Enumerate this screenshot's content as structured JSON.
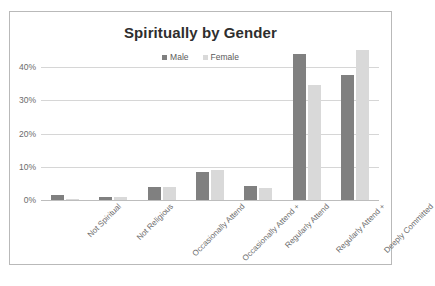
{
  "chart_data": {
    "type": "bar",
    "title": "Spiritually by Gender",
    "xlabel": "",
    "ylabel": "",
    "ylim": [
      0,
      45
    ],
    "ytick_labels": [
      "40%",
      "30%",
      "20%",
      "10%",
      "0%"
    ],
    "ytick_values": [
      40,
      30,
      20,
      10,
      0
    ],
    "grid": true,
    "legend_position": "top-center",
    "categories": [
      "Not Spiritual",
      "Not Religious",
      "Occasionally Attend",
      "Occasionally Attend +",
      "Regularly Attend",
      "Regularly Attend +",
      "Deeply Committed"
    ],
    "series": [
      {
        "name": "Male",
        "color": "#808080",
        "values": [
          1.5,
          1.0,
          4.0,
          8.5,
          4.2,
          44.0,
          37.5
        ]
      },
      {
        "name": "Female",
        "color": "#d9d9d9",
        "values": [
          0.2,
          1.0,
          4.0,
          9.0,
          3.5,
          34.5,
          45.0
        ]
      }
    ]
  },
  "frame": {
    "border_color": "#b9b9b9",
    "background": "#ffffff"
  }
}
